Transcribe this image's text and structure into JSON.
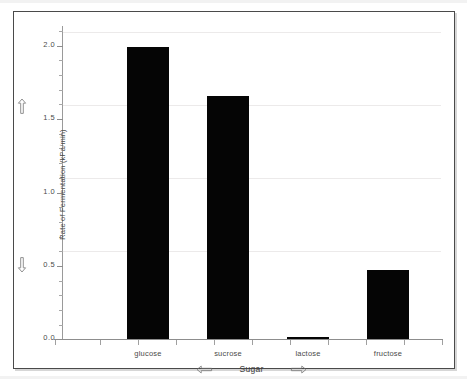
{
  "chart_data": {
    "type": "bar",
    "title": "",
    "xlabel": "Sugar",
    "ylabel": "Rate of Fermentation (kPa/min)",
    "categories": [
      "glucose",
      "sucrose",
      "lactose",
      "fructose"
    ],
    "values": [
      2.0,
      1.66,
      0.01,
      0.475
    ],
    "ylim": [
      0.0,
      2.1
    ],
    "xlim": [
      0,
      5
    ],
    "y_ticks": [
      0.0,
      0.5,
      1.0,
      1.5,
      2.0
    ],
    "y_tick_labels": [
      "0.0",
      "0.5",
      "1.0",
      "1.5",
      "2.0"
    ],
    "y_minor_tick_step": 0.1,
    "grid": "horizontal",
    "legend": "none",
    "bar_color": "#050505",
    "grid_color": "#eceaea",
    "axis_color": "#8d8d8d",
    "text_color": "#4a4a4a",
    "series": [
      {
        "name": "Rate of Fermentation",
        "values": [
          2.0,
          1.66,
          0.01,
          0.475
        ]
      }
    ]
  },
  "axes": {
    "y": {
      "title": "Rate of Fermentation (kPa/min)",
      "ticks": [
        {
          "label": "2.0",
          "value": 2.0
        },
        {
          "label": "1.5",
          "value": 1.5
        },
        {
          "label": "1.0",
          "value": 1.0
        },
        {
          "label": "0.5",
          "value": 0.5
        },
        {
          "label": "0.0",
          "value": 0.0
        }
      ]
    },
    "x": {
      "title": "Sugar",
      "categories": [
        "glucose",
        "sucrose",
        "lactose",
        "fructose"
      ]
    }
  },
  "controls": {
    "scroll_up": "up-arrow-icon",
    "scroll_down": "down-arrow-icon",
    "pan_left": "left-arrow-icon",
    "pan_right": "right-arrow-icon"
  }
}
